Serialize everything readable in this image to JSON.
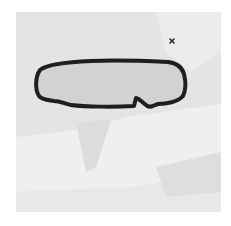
{
  "image": {
    "description": "Grayscale square with a black-outlined rounded elongated shape resembling a rear-view mirror silhouette and a small x mark",
    "colors": {
      "page_background": "#ffffff",
      "panel_base": "#e4e4e4",
      "panel_light_region": "#efefef",
      "panel_shadow_region": "#dadada",
      "shape_fill": "#d2d2d2",
      "shape_outline": "#1e1e1e",
      "x_mark": "#2a2a2a"
    },
    "shape": {
      "label": "mirror-outline"
    },
    "marker": {
      "glyph": "×"
    },
    "faint_text_lines": [
      "",
      "",
      ""
    ]
  }
}
